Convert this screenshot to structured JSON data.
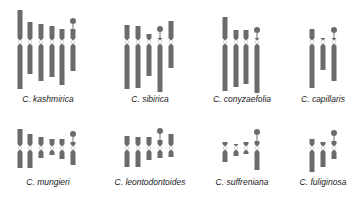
{
  "figure": {
    "colors": {
      "chromosome": "#6b6b6b",
      "background": "#ffffff",
      "label": "#222222"
    },
    "species": [
      {
        "name": "C. kashmirica",
        "label_x": 48,
        "label_y": 100,
        "chromosomes": [
          {
            "x": 20,
            "top": 10,
            "cen": 42,
            "bottom": 89,
            "sat": false
          },
          {
            "x": 30,
            "top": 22,
            "cen": 42,
            "bottom": 74,
            "sat": false
          },
          {
            "x": 41,
            "top": 24,
            "cen": 42,
            "bottom": 81,
            "sat": false
          },
          {
            "x": 52,
            "top": 26,
            "cen": 42,
            "bottom": 77,
            "sat": false
          },
          {
            "x": 62,
            "top": 29,
            "cen": 42,
            "bottom": 85,
            "sat": false
          },
          {
            "x": 73,
            "top": 29,
            "cen": 42,
            "bottom": 71,
            "sat": true,
            "sat_y": 21
          }
        ]
      },
      {
        "name": "C. sibirica",
        "label_x": 150,
        "label_y": 100,
        "chromosomes": [
          {
            "x": 127,
            "top": 25,
            "cen": 42,
            "bottom": 89,
            "sat": false
          },
          {
            "x": 138,
            "top": 26,
            "cen": 42,
            "bottom": 88,
            "sat": false
          },
          {
            "x": 149,
            "top": 34,
            "cen": 42,
            "bottom": 76,
            "sat": false
          },
          {
            "x": 160,
            "top": 38,
            "cen": 42,
            "bottom": 92,
            "sat": true,
            "sat_y": 29
          },
          {
            "x": 171,
            "top": 21,
            "cen": 42,
            "bottom": 68,
            "sat": false
          }
        ]
      },
      {
        "name": "C. conyzaefolia",
        "label_x": 242,
        "label_y": 100,
        "chromosomes": [
          {
            "x": 225,
            "top": 17,
            "cen": 42,
            "bottom": 91,
            "sat": false
          },
          {
            "x": 236,
            "top": 30,
            "cen": 42,
            "bottom": 87,
            "sat": false
          },
          {
            "x": 246,
            "top": 30,
            "cen": 42,
            "bottom": 84,
            "sat": false
          },
          {
            "x": 257,
            "top": 38,
            "cen": 42,
            "bottom": 93,
            "sat": true,
            "sat_y": 30
          }
        ]
      },
      {
        "name": "C. capillaris",
        "label_x": 323,
        "label_y": 100,
        "chromosomes": [
          {
            "x": 312,
            "top": 29,
            "cen": 42,
            "bottom": 88,
            "sat": false
          },
          {
            "x": 323,
            "top": 38,
            "cen": 42,
            "bottom": 70,
            "sat": false
          },
          {
            "x": 334,
            "top": 38,
            "cen": 42,
            "bottom": 81,
            "sat": true,
            "sat_y": 30
          }
        ]
      },
      {
        "name": "C. mungieri",
        "label_x": 48,
        "label_y": 183,
        "chromosomes": [
          {
            "x": 20,
            "top": 129,
            "cen": 148,
            "bottom": 168,
            "sat": false
          },
          {
            "x": 30,
            "top": 134,
            "cen": 148,
            "bottom": 168,
            "sat": false
          },
          {
            "x": 41,
            "top": 137,
            "cen": 148,
            "bottom": 158,
            "sat": false
          },
          {
            "x": 52,
            "top": 139,
            "cen": 148,
            "bottom": 155,
            "sat": false
          },
          {
            "x": 62,
            "top": 139,
            "cen": 148,
            "bottom": 159,
            "sat": false
          },
          {
            "x": 73,
            "top": 142,
            "cen": 148,
            "bottom": 165,
            "sat": true,
            "sat_y": 134
          }
        ]
      },
      {
        "name": "C. leontodontoides",
        "label_x": 150,
        "label_y": 183,
        "chromosomes": [
          {
            "x": 127,
            "top": 136,
            "cen": 148,
            "bottom": 167,
            "sat": false
          },
          {
            "x": 138,
            "top": 137,
            "cen": 148,
            "bottom": 167,
            "sat": false
          },
          {
            "x": 149,
            "top": 137,
            "cen": 148,
            "bottom": 160,
            "sat": false
          },
          {
            "x": 160,
            "top": 140,
            "cen": 148,
            "bottom": 158,
            "sat": true,
            "sat_y": 131
          },
          {
            "x": 171,
            "top": 134,
            "cen": 148,
            "bottom": 157,
            "sat": false
          }
        ]
      },
      {
        "name": "C. suffreniana",
        "label_x": 242,
        "label_y": 183,
        "chromosomes": [
          {
            "x": 225,
            "top": 142,
            "cen": 148,
            "bottom": 162,
            "sat": false
          },
          {
            "x": 236,
            "top": 144,
            "cen": 148,
            "bottom": 156,
            "sat": false
          },
          {
            "x": 246,
            "top": 142,
            "cen": 148,
            "bottom": 154,
            "sat": false
          },
          {
            "x": 257,
            "top": 141,
            "cen": 148,
            "bottom": 170,
            "sat": true,
            "sat_y": 132
          }
        ]
      },
      {
        "name": "C. fuliginosa",
        "label_x": 323,
        "label_y": 183,
        "chromosomes": [
          {
            "x": 312,
            "top": 139,
            "cen": 148,
            "bottom": 172,
            "sat": false
          },
          {
            "x": 323,
            "top": 142,
            "cen": 148,
            "bottom": 167,
            "sat": false
          },
          {
            "x": 334,
            "top": 141,
            "cen": 148,
            "bottom": 159,
            "sat": true,
            "sat_y": 133
          }
        ]
      }
    ]
  }
}
